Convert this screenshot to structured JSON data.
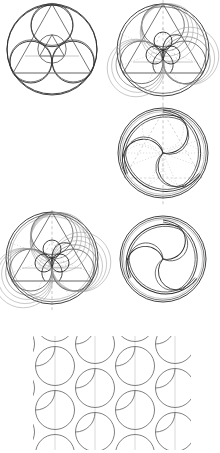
{
  "figure": {
    "background": "#ffffff",
    "ink_color": "#2b2b2b",
    "guide_color": "#a8a8a8",
    "width": 220,
    "height": 453,
    "panel_count": 7
  },
  "panels": [
    {
      "id": "p1",
      "name": "three-tangent-circles-in-circle",
      "caption": "Three equal mutually tangent circles inscribed in a bounding circle",
      "x": 8,
      "y": 2,
      "w": 100,
      "h": 100,
      "cx": 52,
      "cy": 50,
      "outer_radius": 45,
      "inner_radius": 20.9,
      "inner_centers": [
        [
          52,
          25.8
        ],
        [
          30.9,
          62.1
        ],
        [
          73.1,
          62.1
        ]
      ],
      "guides": false
    },
    {
      "id": "p2",
      "name": "arc-web-construction",
      "caption": "Arc web with triangle, radial guides and seed spiral",
      "x": 112,
      "y": 2,
      "w": 102,
      "h": 100,
      "cx": 163,
      "cy": 50,
      "outer_radius": 46,
      "inner_radius": 21.3,
      "inner_centers": [
        [
          163,
          25.3
        ],
        [
          141.5,
          62.3
        ],
        [
          184.5,
          62.3
        ]
      ],
      "guides": true,
      "arc_families": 3,
      "arc_offsets": [
        0,
        2.6,
        5.2,
        7.8
      ],
      "triangle": true,
      "vertical_axis": true
    },
    {
      "id": "p3",
      "name": "triangles-and-incircle",
      "caption": "Inscribed equilateral triangles with central circle",
      "x": 8,
      "y": 104,
      "w": 100,
      "h": 100,
      "cx": 52,
      "cy": 153,
      "outer_radius": 45,
      "inner_radius": 21,
      "inner_centers": [
        [
          52,
          128.4
        ],
        [
          30.8,
          164.9
        ],
        [
          73.2,
          164.9
        ]
      ],
      "central_radius": 14.2,
      "triangle": true,
      "guides": false
    },
    {
      "id": "p4",
      "name": "triskelion-with-guides",
      "caption": "Triskelion ribbon with dotted construction overlay",
      "x": 112,
      "y": 104,
      "w": 102,
      "h": 100,
      "cx": 163,
      "cy": 153,
      "outer_radius": 45,
      "lobe_radius": 20.5,
      "lobe_centers": [
        [
          163,
          128.6
        ],
        [
          141.8,
          165.2
        ],
        [
          184.2,
          165.2
        ]
      ],
      "ribbon_offsets": [
        0,
        1.7,
        3.3
      ],
      "guides": true,
      "vertical_axis": true
    },
    {
      "id": "p5",
      "name": "dense-arc-overlay",
      "caption": "Dense overlay of offset circles, triangle and radial guides",
      "x": 8,
      "y": 208,
      "w": 100,
      "h": 102,
      "cx": 52,
      "cy": 258,
      "outer_radius": 46,
      "inner_radius": 21,
      "inner_centers": [
        [
          52,
          233.5
        ],
        [
          30.8,
          270
        ],
        [
          73.2,
          270
        ]
      ],
      "arc_offsets": [
        0,
        2.2,
        4.4,
        6.6,
        8.8
      ],
      "triangle": true,
      "guides": true,
      "vertical_axis": true
    },
    {
      "id": "p6",
      "name": "triskelion-clean",
      "caption": "Finished triskelion, ribbon outline only",
      "x": 112,
      "y": 208,
      "w": 102,
      "h": 102,
      "cx": 163,
      "cy": 259,
      "outer_radius": 43,
      "lobe_radius": 20,
      "lobe_centers": [
        [
          163,
          236
        ],
        [
          142.2,
          271
        ],
        [
          183.8,
          271
        ]
      ],
      "ribbon_offsets": [
        0,
        1.8,
        3.6
      ],
      "guides": false
    },
    {
      "id": "p7",
      "name": "circle-packing-tiling",
      "caption": "Hexagonal circle packing with concave interstitial arcs",
      "x": 30,
      "y": 334,
      "w": 165,
      "h": 117,
      "circle_radius": 19.5,
      "col_step": 40,
      "row_step": 44,
      "columns": 3,
      "offset_columns": 2,
      "centers": [
        [
          55,
          366
        ],
        [
          55,
          410
        ],
        [
          55,
          454
        ],
        [
          95,
          344
        ],
        [
          95,
          388
        ],
        [
          95,
          432
        ],
        [
          135,
          366
        ],
        [
          135,
          410
        ],
        [
          135,
          454
        ],
        [
          175,
          344
        ],
        [
          175,
          388
        ],
        [
          175,
          432
        ]
      ],
      "vertical_rules": [
        55,
        95,
        135,
        175
      ],
      "pinch_arcs": true
    }
  ],
  "legend": {
    "solid_stroke": "construction / final outline",
    "dashed_stroke": "radial and axial guides",
    "pale_stroke": "secondary offset arcs"
  }
}
